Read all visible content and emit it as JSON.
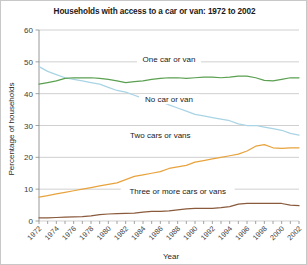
{
  "chart_data": {
    "type": "line",
    "title": "Households with access to a car or van: 1972 to 2002",
    "xlabel": "Year",
    "ylabel": "Percentage of households",
    "ylim": [
      0,
      60
    ],
    "yticks": [
      0,
      10,
      20,
      30,
      40,
      50,
      60
    ],
    "xlim": [
      1972,
      2002
    ],
    "grid": "horizontal",
    "legend_position": "inline-labels",
    "x": [
      1972,
      1973,
      1974,
      1975,
      1976,
      1977,
      1978,
      1979,
      1980,
      1981,
      1982,
      1983,
      1984,
      1985,
      1986,
      1987,
      1988,
      1989,
      1990,
      1991,
      1992,
      1993,
      1994,
      1995,
      1996,
      1997,
      1998,
      1999,
      2000,
      2001,
      2002
    ],
    "xtick_labels": [
      "1972",
      "1974",
      "1976",
      "1978",
      "1980",
      "1982",
      "1984",
      "1986",
      "1988",
      "1990",
      "1992",
      "1994",
      "1996",
      "1998",
      "2000",
      "2002"
    ],
    "series": [
      {
        "name": "No car or van",
        "color": "#a8d4e4",
        "label_x": 1987,
        "label_y": 37.5,
        "values": [
          48.5,
          47.0,
          46.0,
          45.0,
          44.5,
          44.0,
          43.5,
          43.0,
          42.0,
          41.0,
          40.5,
          39.5,
          38.5,
          38.0,
          37.5,
          36.5,
          35.5,
          34.5,
          33.5,
          33.0,
          32.5,
          32.0,
          31.5,
          30.5,
          30.0,
          30.0,
          29.5,
          29.0,
          28.5,
          27.5,
          27.0
        ]
      },
      {
        "name": "One car or van",
        "color": "#5aa050",
        "label_x": 1987,
        "label_y": 50.0,
        "values": [
          43.0,
          43.5,
          44.0,
          44.8,
          45.0,
          45.0,
          45.0,
          44.8,
          44.5,
          44.0,
          43.5,
          43.8,
          44.0,
          44.5,
          44.8,
          45.0,
          45.0,
          44.8,
          45.0,
          45.2,
          45.2,
          45.0,
          45.2,
          45.5,
          45.5,
          45.0,
          44.2,
          44.0,
          44.5,
          45.0,
          45.0
        ]
      },
      {
        "name": "Two cars or vans",
        "color": "#e8a33d",
        "label_x": 1986,
        "label_y": 26.0,
        "values": [
          7.5,
          8.0,
          8.5,
          9.0,
          9.5,
          10.0,
          10.5,
          11.0,
          11.5,
          12.0,
          13.0,
          14.0,
          14.5,
          15.0,
          15.5,
          16.5,
          17.0,
          17.5,
          18.5,
          19.0,
          19.5,
          20.0,
          20.5,
          21.0,
          22.0,
          23.5,
          24.0,
          23.0,
          22.8,
          23.0,
          23.0
        ]
      },
      {
        "name": "Three or more cars or vans",
        "color": "#8a5a3c",
        "label_x": 1988,
        "label_y": 8.5,
        "values": [
          1.0,
          1.0,
          1.1,
          1.2,
          1.3,
          1.4,
          1.6,
          2.0,
          2.2,
          2.3,
          2.4,
          2.5,
          2.8,
          3.0,
          3.0,
          3.2,
          3.5,
          3.8,
          4.0,
          4.0,
          4.0,
          4.2,
          4.5,
          5.3,
          5.5,
          5.5,
          5.5,
          5.5,
          5.5,
          5.0,
          4.8
        ]
      }
    ]
  }
}
